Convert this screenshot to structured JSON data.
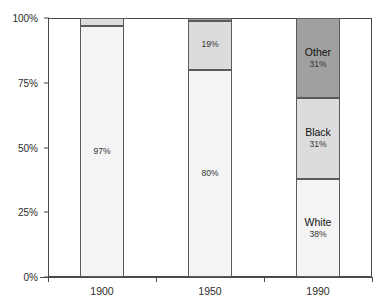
{
  "chart_data": {
    "type": "bar",
    "subtype": "100% stacked column",
    "title": "",
    "xlabel": "",
    "ylabel": "",
    "categories": [
      "1900",
      "1950",
      "1990"
    ],
    "ylim": [
      0,
      100
    ],
    "y_ticks": [
      0,
      25,
      50,
      75,
      100
    ],
    "y_tick_labels": [
      "0%",
      "25%",
      "50%",
      "75%",
      "100%"
    ],
    "grid": false,
    "legend": "none (in-bar labels)",
    "series": [
      {
        "name": "White",
        "color": "#f4f4f4",
        "values": [
          97,
          80,
          38
        ],
        "labels": [
          "97%",
          "80%",
          "38%"
        ]
      },
      {
        "name": "Black",
        "color": "#dcdcdc",
        "values": [
          3,
          19,
          31
        ],
        "labels": [
          "",
          "19%",
          "31%"
        ]
      },
      {
        "name": "Other",
        "color": "#a0a0a0",
        "values": [
          0,
          1,
          31
        ],
        "labels": [
          "",
          "",
          "31%"
        ]
      }
    ],
    "bars": [
      {
        "category": "1900",
        "segments": [
          {
            "name": "",
            "value": 97,
            "label": "97%",
            "color": "#f4f4f4",
            "show_name": false,
            "show_value": true
          },
          {
            "name": "",
            "value": 3,
            "label": "",
            "color": "#dcdcdc",
            "show_name": false,
            "show_value": false
          }
        ]
      },
      {
        "category": "1950",
        "segments": [
          {
            "name": "",
            "value": 80,
            "label": "80%",
            "color": "#f4f4f4",
            "show_name": false,
            "show_value": true
          },
          {
            "name": "",
            "value": 19,
            "label": "19%",
            "color": "#dcdcdc",
            "show_name": false,
            "show_value": true
          },
          {
            "name": "",
            "value": 1,
            "label": "",
            "color": "#a0a0a0",
            "show_name": false,
            "show_value": false
          }
        ]
      },
      {
        "category": "1990",
        "segments": [
          {
            "name": "White",
            "value": 38,
            "label": "38%",
            "color": "#f4f4f4",
            "show_name": true,
            "show_value": true
          },
          {
            "name": "Black",
            "value": 31,
            "label": "31%",
            "color": "#dcdcdc",
            "show_name": true,
            "show_value": true
          },
          {
            "name": "Other",
            "value": 31,
            "label": "31%",
            "color": "#a0a0a0",
            "show_name": true,
            "show_value": true
          }
        ]
      }
    ]
  }
}
